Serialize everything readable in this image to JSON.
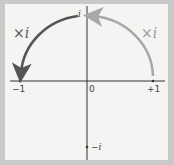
{
  "diagram": {
    "axis_labels": {
      "neg_one": "−1",
      "zero": "0",
      "pos_one": "+1",
      "i": "i",
      "neg_i": "−i"
    },
    "arrows": [
      {
        "from": "+1",
        "to": "i",
        "label": "×i",
        "color": "#a8a8a8"
      },
      {
        "from": "i",
        "to": "-1",
        "label": "×i",
        "color": "#555555"
      }
    ]
  }
}
